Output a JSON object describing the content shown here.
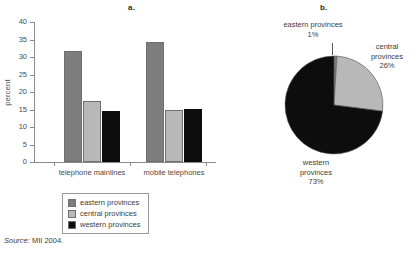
{
  "panels": {
    "a_label": "a.",
    "b_label": "b."
  },
  "source": {
    "lead": "Source:",
    "text": "MII 2004."
  },
  "legend": {
    "items": [
      {
        "label": "eastern provinces",
        "color": "#7d7d7d"
      },
      {
        "label": "central provinces",
        "color": "#b8b8b8"
      },
      {
        "label": "western provinces",
        "color": "#0d0d0d"
      }
    ]
  },
  "chart_data": [
    {
      "type": "bar",
      "title": "a.",
      "xlabel": "",
      "ylabel": "percent",
      "ylim": [
        0,
        40
      ],
      "yticks": [
        0,
        5,
        10,
        15,
        20,
        25,
        30,
        35,
        40
      ],
      "ytick_labels": [
        "0",
        "5",
        "10",
        "15",
        "20",
        "25",
        "30",
        "35",
        "40"
      ],
      "grid": false,
      "legend_position": "below",
      "categories": [
        "telephone mainlines",
        "mobile telephones"
      ],
      "series": [
        {
          "name": "eastern provinces",
          "color": "#7d7d7d",
          "values": [
            31.8,
            34.3
          ]
        },
        {
          "name": "central provinces",
          "color": "#b8b8b8",
          "values": [
            17.5,
            15.0
          ]
        },
        {
          "name": "western provinces",
          "color": "#0d0d0d",
          "values": [
            14.7,
            15.1
          ]
        }
      ]
    },
    {
      "type": "pie",
      "title": "b.",
      "labels": [
        "eastern provinces",
        "central provinces",
        "western provinces"
      ],
      "values": [
        1,
        26,
        73
      ],
      "value_labels": [
        "1%",
        "26%",
        "73%"
      ],
      "colors": [
        "#7d7d7d",
        "#b8b8b8",
        "#0d0d0d"
      ],
      "start_angle_deg": 0,
      "direction": "clockwise",
      "annotations": [
        {
          "name": "eastern provinces",
          "line1": "eastern provinces",
          "line2": "1%"
        },
        {
          "name": "central provinces",
          "line1": "central",
          "line2": "provinces",
          "line3": "26%"
        },
        {
          "name": "western provinces",
          "line1": "western",
          "line2": "provinces",
          "line3": "73%"
        }
      ]
    }
  ]
}
